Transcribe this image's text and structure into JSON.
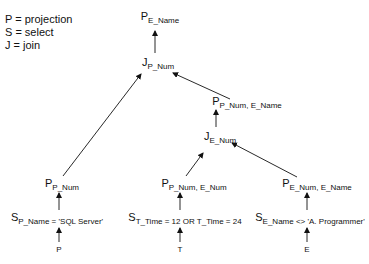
{
  "legend": [
    {
      "symbol": "P",
      "meaning": "P = projection"
    },
    {
      "symbol": "S",
      "meaning": "S = select"
    },
    {
      "symbol": "J",
      "meaning": "J = join"
    }
  ],
  "nodes": {
    "root": {
      "op": "P",
      "sub": "E_Name"
    },
    "join_pnum": {
      "op": "J",
      "sub": "P_Num"
    },
    "proj_pnum_ename": {
      "op": "P",
      "sub": "P_Num, E_Name"
    },
    "join_enum": {
      "op": "J",
      "sub": "E_Num"
    },
    "proj_pnum": {
      "op": "P",
      "sub": "P_Num"
    },
    "proj_pnum_enum": {
      "op": "P",
      "sub": "P_Num, E_Num"
    },
    "proj_enum_ename": {
      "op": "P",
      "sub": "E_Num, E_Name"
    },
    "sel_p": {
      "op": "S",
      "sub": "P_Name = 'SQL Server'"
    },
    "sel_t": {
      "op": "S",
      "sub": "T_Time = 12 OR T_Time = 24"
    },
    "sel_e": {
      "op": "S",
      "sub": "E_Name <> 'A. Programmer'"
    }
  },
  "leaves": {
    "p": "P",
    "t": "T",
    "e": "E"
  }
}
